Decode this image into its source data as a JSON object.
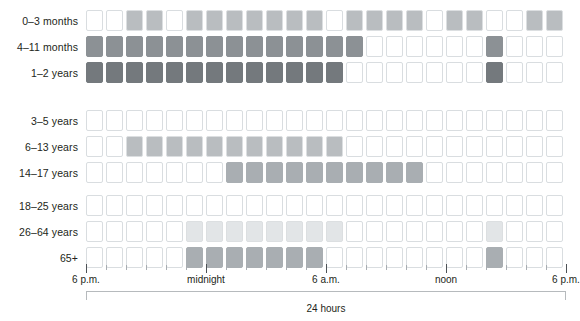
{
  "chart_data": {
    "type": "heatmap",
    "title": "",
    "xlabel": "24 hours",
    "ylabel": "",
    "grid": false,
    "legend_position": "none",
    "columns": 24,
    "column_hours": [
      "6 p.m.",
      "7 p.m.",
      "8 p.m.",
      "9 p.m.",
      "10 p.m.",
      "11 p.m.",
      "midnight",
      "1 a.m.",
      "2 a.m.",
      "3 a.m.",
      "4 a.m.",
      "5 a.m.",
      "6 a.m.",
      "7 a.m.",
      "8 a.m.",
      "9 a.m.",
      "10 a.m.",
      "11 a.m.",
      "noon",
      "1 p.m.",
      "2 p.m.",
      "3 p.m.",
      "4 p.m.",
      "5 p.m."
    ],
    "x_tick_labels": [
      {
        "label": "6 p.m.",
        "index": 0
      },
      {
        "label": "midnight",
        "index": 6
      },
      {
        "label": "6 a.m.",
        "index": 12
      },
      {
        "label": "noon",
        "index": 18
      },
      {
        "label": "6 p.m.",
        "index": 24
      }
    ],
    "major_tick_indices": [
      0,
      6,
      12,
      18,
      24
    ],
    "shade_colors": {
      "none": "#ffffff",
      "light": "#eef0f1",
      "light2": "#e2e5e7",
      "medium": "#b9bdc0",
      "medium2": "#a9aeb2",
      "dark": "#8c9195",
      "darker": "#74797d"
    },
    "groups": [
      {
        "name": "infants",
        "rows": [
          {
            "label": "0–3 months",
            "values": [
              0,
              0,
              3,
              3,
              0,
              3,
              3,
              3,
              3,
              3,
              3,
              3,
              0,
              3,
              3,
              3,
              3,
              0,
              3,
              3,
              0,
              0,
              3,
              3
            ]
          },
          {
            "label": "4–11 months",
            "values": [
              5,
              5,
              5,
              5,
              5,
              5,
              5,
              5,
              5,
              5,
              5,
              5,
              5,
              5,
              0,
              0,
              0,
              0,
              0,
              0,
              5,
              0,
              0,
              0
            ]
          },
          {
            "label": "1–2 years",
            "values": [
              6,
              6,
              6,
              6,
              6,
              6,
              6,
              6,
              6,
              6,
              6,
              6,
              6,
              0,
              0,
              0,
              0,
              0,
              0,
              0,
              6,
              0,
              0,
              0
            ]
          }
        ]
      },
      {
        "name": "children",
        "rows": [
          {
            "label": "3–5 years",
            "values": [
              0,
              0,
              0,
              0,
              0,
              0,
              0,
              0,
              0,
              0,
              0,
              0,
              0,
              0,
              0,
              0,
              0,
              0,
              0,
              0,
              0,
              0,
              0,
              0
            ]
          },
          {
            "label": "6–13 years",
            "values": [
              0,
              0,
              3,
              3,
              3,
              3,
              3,
              3,
              3,
              3,
              3,
              3,
              3,
              0,
              0,
              0,
              0,
              0,
              0,
              0,
              0,
              0,
              0,
              0
            ]
          },
          {
            "label": "14–17 years",
            "values": [
              0,
              0,
              0,
              0,
              0,
              0,
              0,
              4,
              4,
              4,
              4,
              4,
              4,
              4,
              4,
              4,
              4,
              0,
              0,
              0,
              0,
              0,
              0,
              0
            ]
          }
        ]
      },
      {
        "name": "adults",
        "rows": [
          {
            "label": "18–25 years",
            "values": [
              0,
              0,
              0,
              0,
              0,
              0,
              0,
              0,
              0,
              0,
              0,
              0,
              0,
              0,
              0,
              0,
              0,
              0,
              0,
              0,
              0,
              0,
              0,
              0
            ]
          },
          {
            "label": "26–64 years",
            "values": [
              0,
              0,
              0,
              0,
              0,
              2,
              2,
              2,
              2,
              2,
              2,
              2,
              2,
              0,
              0,
              0,
              0,
              0,
              0,
              0,
              2,
              0,
              0,
              0
            ]
          },
          {
            "label": "65+",
            "values": [
              0,
              0,
              0,
              0,
              0,
              4,
              4,
              4,
              4,
              4,
              4,
              4,
              0,
              0,
              0,
              0,
              0,
              0,
              0,
              0,
              4,
              0,
              0,
              0
            ]
          }
        ]
      }
    ]
  }
}
